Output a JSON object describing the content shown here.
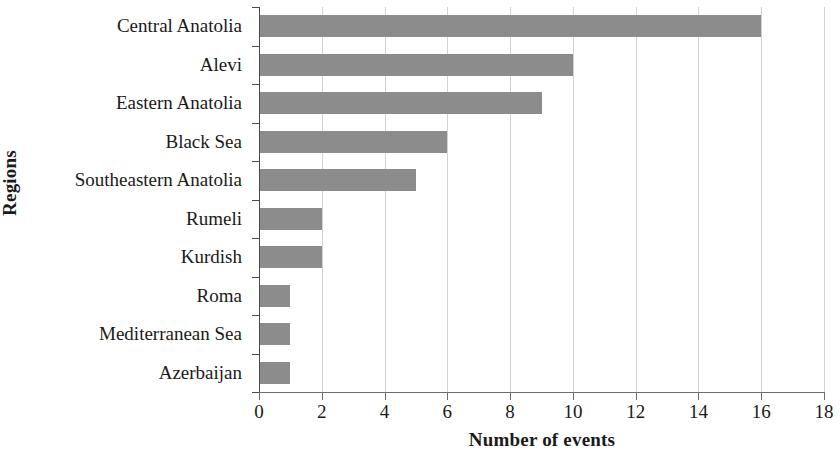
{
  "chart_data": {
    "type": "bar",
    "orientation": "horizontal",
    "title": "",
    "xlabel": "Number of events",
    "ylabel": "Regions",
    "categories": [
      "Central Anatolia",
      "Alevi",
      "Eastern Anatolia",
      "Black Sea",
      "Southeastern Anatolia",
      "Rumeli",
      "Kurdish",
      "Roma",
      "Mediterranean Sea",
      "Azerbaijan"
    ],
    "values": [
      16,
      10,
      9,
      6,
      5,
      2,
      2,
      1,
      1,
      1
    ],
    "xlim": [
      0,
      18
    ],
    "xticks": [
      0,
      2,
      4,
      6,
      8,
      10,
      12,
      14,
      16,
      18
    ],
    "xtick_labels": [
      "0",
      "2",
      "4",
      "6",
      "8",
      "10",
      "12",
      "14",
      "16",
      "18"
    ],
    "grid": "vertical",
    "legend": "none",
    "bar_color": "#8c8c8c",
    "gridline_color": "#d2d2d2",
    "axis_color": "#4a4a4a",
    "background_color": "#ffffff"
  }
}
